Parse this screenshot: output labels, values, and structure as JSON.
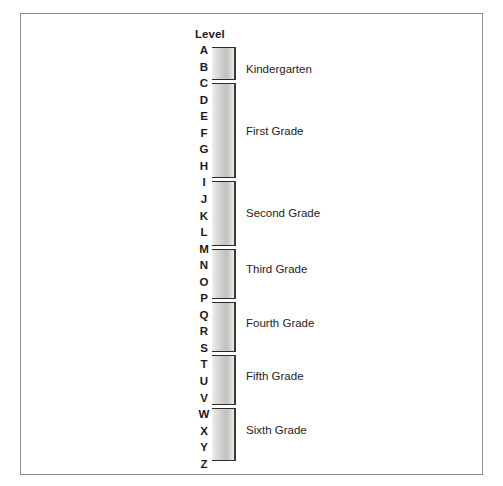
{
  "figure": {
    "axis_title": "Level",
    "levels": [
      "A",
      "B",
      "C",
      "D",
      "E",
      "F",
      "G",
      "H",
      "I",
      "J",
      "K",
      "L",
      "M",
      "N",
      "O",
      "P",
      "Q",
      "R",
      "S",
      "T",
      "U",
      "V",
      "W",
      "X",
      "Y",
      "Z"
    ],
    "border_color": "#8e8e8e",
    "bar_edge_color": "#2b2b2b"
  },
  "chart_data": {
    "type": "bar",
    "title": "",
    "subtitle": "",
    "xlabel": "",
    "ylabel": "Level",
    "orientation": "vertical-range",
    "grid": false,
    "legend": "none",
    "axis_categories": [
      "A",
      "B",
      "C",
      "D",
      "E",
      "F",
      "G",
      "H",
      "I",
      "J",
      "K",
      "L",
      "M",
      "N",
      "O",
      "P",
      "Q",
      "R",
      "S",
      "T",
      "U",
      "V",
      "W",
      "X",
      "Y",
      "Z"
    ],
    "axis_range": [
      "A",
      "Z"
    ],
    "annotations": [
      "Level"
    ],
    "series": [
      {
        "name": "Kindergarten",
        "start_level": "A",
        "end_level": "C",
        "label": "Kindergarten",
        "top_px": 0,
        "height_px": 33,
        "label_center_px": 22
      },
      {
        "name": "First Grade",
        "start_level": "C",
        "end_level": "I",
        "label": "First Grade",
        "top_px": 36,
        "height_px": 95,
        "label_center_px": 84
      },
      {
        "name": "Second Grade",
        "start_level": "I",
        "end_level": "M",
        "label": "Second Grade",
        "top_px": 134,
        "height_px": 65,
        "label_center_px": 166
      },
      {
        "name": "Third Grade",
        "start_level": "M",
        "end_level": "P",
        "label": "Third Grade",
        "top_px": 202,
        "height_px": 50,
        "label_center_px": 222
      },
      {
        "name": "Fourth Grade",
        "start_level": "P",
        "end_level": "S",
        "label": "Fourth Grade",
        "top_px": 255,
        "height_px": 50,
        "label_center_px": 276
      },
      {
        "name": "Fifth Grade",
        "start_level": "S",
        "end_level": "V",
        "label": "Fifth Grade",
        "top_px": 308,
        "height_px": 50,
        "label_center_px": 329
      },
      {
        "name": "Sixth Grade",
        "start_level": "W",
        "end_level": "Z",
        "label": "Sixth Grade",
        "top_px": 361,
        "height_px": 53,
        "label_center_px": 383
      }
    ]
  }
}
